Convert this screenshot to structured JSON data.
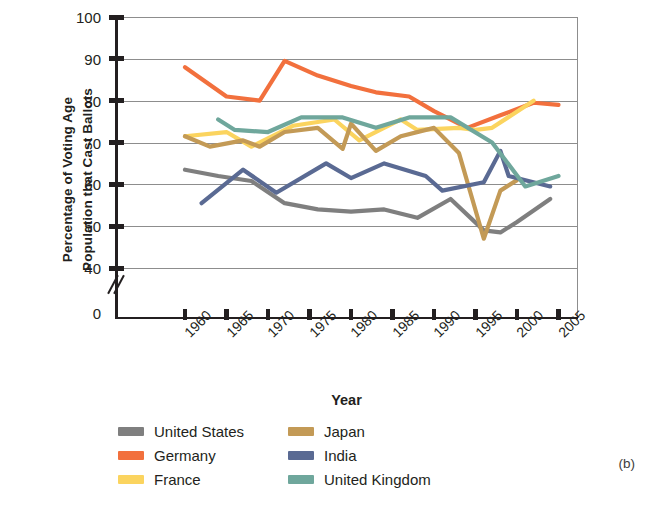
{
  "panel_label": "(b)",
  "axes": {
    "ylabel": "Percentage of Voting Age\nPopulation that Cast Ballots",
    "xlabel": "Year",
    "yticks": [
      "100",
      "90",
      "80",
      "70",
      "60",
      "50",
      "40",
      "0"
    ],
    "xticks": [
      "1960",
      "1965",
      "1970",
      "1975",
      "1980",
      "1985",
      "1990",
      "1995",
      "2000",
      "2005"
    ]
  },
  "legend": {
    "items": [
      {
        "label": "United States",
        "color": "#7f7f7f"
      },
      {
        "label": "Japan",
        "color": "#c39a56"
      },
      {
        "label": "Germany",
        "color": "#f2703d"
      },
      {
        "label": "India",
        "color": "#5a6a93"
      },
      {
        "label": "France",
        "color": "#fbd45f"
      },
      {
        "label": "United Kingdom",
        "color": "#6fa79c"
      }
    ]
  },
  "chart_data": {
    "type": "line",
    "title": "",
    "xlabel": "Year",
    "ylabel": "Percentage of Voting Age Population that Cast Ballots",
    "xlim": [
      1958,
      2007
    ],
    "ylim": [
      37,
      100
    ],
    "yticks": [
      40,
      50,
      60,
      70,
      80,
      90,
      100
    ],
    "xticks": [
      1960,
      1965,
      1970,
      1975,
      1980,
      1985,
      1990,
      1995,
      2000,
      2005
    ],
    "y_axis_break": "between 0 and 40",
    "grid": "horizontal",
    "legend_position": "below",
    "series": [
      {
        "name": "United States",
        "color": "#7f7f7f",
        "points": [
          [
            1960,
            63.5
          ],
          [
            1964,
            62.0
          ],
          [
            1968,
            60.8
          ],
          [
            1972,
            55.5
          ],
          [
            1976,
            54.0
          ],
          [
            1980,
            53.5
          ],
          [
            1984,
            54.0
          ],
          [
            1988,
            52.0
          ],
          [
            1992,
            56.5
          ],
          [
            1996,
            49.0
          ],
          [
            1998,
            48.5
          ],
          [
            2000,
            51.0
          ],
          [
            2004,
            56.5
          ]
        ]
      },
      {
        "name": "Germany",
        "color": "#f2703d",
        "points": [
          [
            1960,
            88.0
          ],
          [
            1965,
            81.0
          ],
          [
            1969,
            80.0
          ],
          [
            1972,
            89.5
          ],
          [
            1976,
            86.0
          ],
          [
            1980,
            83.5
          ],
          [
            1983,
            82.0
          ],
          [
            1987,
            81.0
          ],
          [
            1990,
            77.5
          ],
          [
            1994,
            73.5
          ],
          [
            1998,
            76.5
          ],
          [
            2002,
            79.5
          ],
          [
            2005,
            79.0
          ]
        ]
      },
      {
        "name": "France",
        "color": "#fbd45f",
        "points": [
          [
            1960,
            71.5
          ],
          [
            1965,
            72.5
          ],
          [
            1968,
            69.0
          ],
          [
            1973,
            74.0
          ],
          [
            1978,
            75.5
          ],
          [
            1981,
            70.5
          ],
          [
            1986,
            75.5
          ],
          [
            1988,
            73.0
          ],
          [
            1993,
            73.5
          ],
          [
            1995,
            73.0
          ],
          [
            1997,
            73.5
          ],
          [
            2002,
            80.0
          ]
        ]
      },
      {
        "name": "Japan",
        "color": "#c39a56",
        "points": [
          [
            1960,
            71.5
          ],
          [
            1963,
            69.0
          ],
          [
            1967,
            70.5
          ],
          [
            1969,
            69.0
          ],
          [
            1972,
            72.5
          ],
          [
            1976,
            73.5
          ],
          [
            1979,
            68.5
          ],
          [
            1980,
            74.5
          ],
          [
            1983,
            68.0
          ],
          [
            1986,
            71.5
          ],
          [
            1990,
            73.5
          ],
          [
            1993,
            67.5
          ],
          [
            1996,
            47.0
          ],
          [
            1998,
            58.5
          ],
          [
            2000,
            61.0
          ]
        ]
      },
      {
        "name": "India",
        "color": "#5a6a93",
        "points": [
          [
            1962,
            55.5
          ],
          [
            1967,
            63.5
          ],
          [
            1971,
            58.0
          ],
          [
            1977,
            65.0
          ],
          [
            1980,
            61.5
          ],
          [
            1984,
            65.0
          ],
          [
            1989,
            62.0
          ],
          [
            1991,
            58.5
          ],
          [
            1996,
            60.5
          ],
          [
            1998,
            68.0
          ],
          [
            1999,
            62.0
          ],
          [
            2004,
            59.5
          ]
        ]
      },
      {
        "name": "United Kingdom",
        "color": "#6fa79c",
        "points": [
          [
            1964,
            75.5
          ],
          [
            1966,
            73.0
          ],
          [
            1970,
            72.5
          ],
          [
            1974,
            76.0
          ],
          [
            1979,
            76.0
          ],
          [
            1983,
            73.5
          ],
          [
            1987,
            76.0
          ],
          [
            1992,
            76.0
          ],
          [
            1997,
            70.0
          ],
          [
            2001,
            59.5
          ],
          [
            2005,
            62.0
          ]
        ]
      }
    ]
  }
}
